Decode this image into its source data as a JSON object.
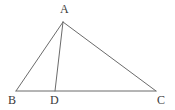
{
  "figure": {
    "type": "euclidean-geometry-diagram",
    "background_color": "#ffffff",
    "stroke_color": "#6b6b6b",
    "label_color": "#3a3a3a",
    "stroke_width": 1,
    "canvas": {
      "width": 175,
      "height": 110
    },
    "points": [
      {
        "id": "A",
        "label": "A",
        "x": 63,
        "y": 22,
        "label_x": 60,
        "label_y": 3
      },
      {
        "id": "B",
        "label": "B",
        "x": 16,
        "y": 91,
        "label_x": 8,
        "label_y": 94
      },
      {
        "id": "D",
        "label": "D",
        "x": 55,
        "y": 91,
        "label_x": 50,
        "label_y": 94
      },
      {
        "id": "C",
        "label": "C",
        "x": 156,
        "y": 91,
        "label_x": 157,
        "label_y": 94
      }
    ],
    "segments": [
      {
        "id": "AB",
        "name": "segment-ab",
        "from": "A",
        "to": "B",
        "x1": 63,
        "y1": 22,
        "x2": 16,
        "y2": 91
      },
      {
        "id": "AC",
        "name": "segment-ac",
        "from": "A",
        "to": "C",
        "x1": 63,
        "y1": 22,
        "x2": 156,
        "y2": 91
      },
      {
        "id": "BC",
        "name": "segment-bc",
        "from": "B",
        "to": "C",
        "x1": 16,
        "y1": 91,
        "x2": 156,
        "y2": 91
      },
      {
        "id": "AD",
        "name": "segment-ad",
        "from": "A",
        "to": "D",
        "x1": 63,
        "y1": 22,
        "x2": 55,
        "y2": 91
      }
    ]
  }
}
